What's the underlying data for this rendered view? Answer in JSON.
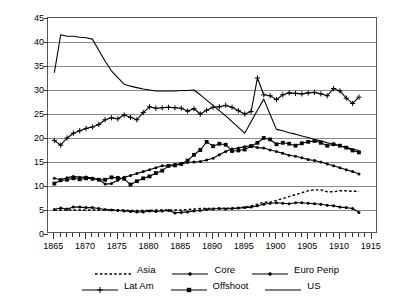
{
  "chart_data": {
    "type": "line",
    "title": "",
    "xlabel": "",
    "ylabel": "Unweighted Average Tariff (%)",
    "xlim": [
      1864,
      1916
    ],
    "ylim": [
      0,
      45
    ],
    "yticks": [
      0,
      5,
      10,
      15,
      20,
      25,
      30,
      35,
      40,
      45
    ],
    "xticks_labeled": [
      1865,
      1870,
      1875,
      1880,
      1885,
      1890,
      1895,
      1900,
      1905,
      1910,
      1915
    ],
    "xtick_interval": 1,
    "grid": "horizontal",
    "legend_position": "below",
    "x": [
      1865,
      1866,
      1867,
      1868,
      1869,
      1870,
      1871,
      1872,
      1873,
      1874,
      1875,
      1876,
      1877,
      1878,
      1879,
      1880,
      1881,
      1882,
      1883,
      1884,
      1885,
      1886,
      1887,
      1888,
      1889,
      1890,
      1891,
      1892,
      1893,
      1894,
      1895,
      1896,
      1897,
      1898,
      1899,
      1900,
      1901,
      1902,
      1903,
      1904,
      1905,
      1906,
      1907,
      1908,
      1909,
      1910,
      1911,
      1912,
      1913
    ],
    "series": [
      {
        "name": "Asia",
        "style": "dotted",
        "marker": "none",
        "color": "#000000",
        "values": [
          5.0,
          5.0,
          5.0,
          5.0,
          5.0,
          5.0,
          5.0,
          5.0,
          5.0,
          5.0,
          5.0,
          5.0,
          4.9,
          4.9,
          4.9,
          4.9,
          5.0,
          5.0,
          5.0,
          5.0,
          5.0,
          5.1,
          5.2,
          5.3,
          5.3,
          5.3,
          5.4,
          5.4,
          5.4,
          5.5,
          5.6,
          5.8,
          6.2,
          6.6,
          6.6,
          7.0,
          7.4,
          7.8,
          8.2,
          8.6,
          9.0,
          9.2,
          9.2,
          8.8,
          8.8,
          9.0,
          9.0,
          8.9,
          8.9
        ]
      },
      {
        "name": "Core",
        "style": "solid",
        "marker": "dot",
        "color": "#000000",
        "values": [
          5.1,
          5.4,
          5.2,
          5.6,
          5.6,
          5.5,
          5.5,
          5.3,
          5.1,
          5.0,
          4.9,
          4.8,
          4.7,
          4.6,
          4.6,
          4.8,
          4.7,
          4.8,
          4.9,
          4.4,
          4.5,
          4.6,
          4.8,
          4.9,
          5.1,
          5.2,
          5.3,
          5.2,
          5.3,
          5.4,
          5.5,
          5.6,
          5.9,
          6.2,
          6.4,
          6.5,
          6.4,
          6.3,
          6.5,
          6.5,
          6.4,
          6.3,
          6.2,
          6.0,
          5.9,
          5.6,
          5.5,
          5.3,
          4.5
        ]
      },
      {
        "name": "Euro Perip",
        "style": "solid",
        "marker": "dot",
        "color": "#000000",
        "values": [
          11.6,
          11.3,
          11.7,
          12.0,
          11.8,
          11.9,
          11.6,
          11.4,
          10.4,
          10.5,
          11.2,
          11.8,
          12.2,
          12.6,
          13.0,
          13.4,
          13.8,
          14.2,
          14.2,
          14.5,
          14.6,
          14.9,
          15.0,
          15.1,
          15.4,
          15.8,
          16.5,
          17.2,
          17.7,
          17.9,
          18.2,
          18.4,
          18.0,
          17.9,
          17.5,
          17.2,
          16.8,
          16.4,
          16.2,
          15.9,
          15.5,
          15.3,
          15.0,
          14.6,
          14.2,
          13.8,
          13.4,
          13.0,
          12.5
        ]
      },
      {
        "name": "Lat Am",
        "style": "solid",
        "marker": "plus",
        "color": "#000000",
        "values": [
          19.5,
          18.5,
          20.0,
          21.0,
          21.5,
          22.0,
          22.3,
          22.8,
          23.8,
          24.2,
          24.0,
          24.8,
          24.3,
          23.8,
          25.3,
          26.5,
          26.2,
          26.3,
          26.4,
          26.3,
          26.2,
          25.6,
          26.1,
          25.0,
          25.8,
          26.4,
          26.5,
          26.8,
          26.4,
          25.7,
          25.0,
          25.5,
          32.5,
          29.0,
          28.8,
          28.0,
          29.0,
          29.4,
          29.3,
          29.2,
          29.4,
          29.5,
          29.2,
          28.8,
          30.3,
          29.8,
          28.3,
          27.2,
          28.5
        ]
      },
      {
        "name": "Offshoot",
        "style": "solid",
        "marker": "square",
        "color": "#000000",
        "values": [
          10.5,
          11.2,
          11.3,
          11.6,
          11.4,
          11.6,
          11.5,
          11.3,
          11.3,
          11.8,
          11.7,
          11.5,
          10.3,
          11.0,
          11.6,
          12.0,
          12.7,
          13.2,
          14.2,
          14.3,
          14.6,
          15.3,
          16.5,
          17.5,
          19.2,
          18.3,
          18.8,
          18.6,
          17.3,
          17.4,
          17.6,
          18.3,
          19.0,
          20.0,
          19.7,
          18.7,
          19.0,
          18.8,
          18.4,
          18.9,
          19.2,
          19.4,
          19.0,
          18.4,
          18.7,
          18.4,
          18.0,
          17.4,
          17.0
        ]
      },
      {
        "name": "US",
        "style": "solid",
        "marker": "none",
        "color": "#000000",
        "values": [
          33.6,
          41.5,
          41.2,
          41.2,
          41.0,
          40.9,
          40.6,
          38.3,
          36.0,
          34.0,
          32.6,
          31.2,
          30.8,
          30.5,
          30.2,
          30.0,
          29.8,
          29.8,
          29.8,
          29.8,
          29.9,
          29.9,
          30.0,
          29.0,
          27.9,
          26.8,
          25.7,
          24.6,
          23.4,
          22.2,
          21.0,
          23.4,
          25.8,
          28.1,
          24.9,
          21.8,
          21.5,
          21.1,
          20.8,
          20.4,
          20.1,
          19.7,
          19.4,
          19.0,
          18.7,
          18.4,
          18.0,
          17.7,
          17.4
        ]
      }
    ]
  },
  "legend": {
    "rows": [
      [
        {
          "label": "Asia",
          "marker": "dotted-line"
        },
        {
          "label": "Core",
          "marker": "line-dot"
        },
        {
          "label": "Euro Perip",
          "marker": "line-dot"
        }
      ],
      [
        {
          "label": "Lat Am",
          "marker": "line-plus"
        },
        {
          "label": "Offshoot",
          "marker": "line-square"
        },
        {
          "label": "US",
          "marker": "line-plain"
        }
      ]
    ]
  }
}
